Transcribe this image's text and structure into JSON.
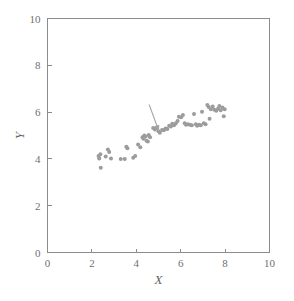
{
  "chart_data": {
    "type": "scatter",
    "title": "",
    "xlabel": "X",
    "ylabel": "Y",
    "xlim": [
      0,
      10
    ],
    "ylim": [
      0,
      10
    ],
    "xticks": [
      0,
      2,
      4,
      6,
      8,
      10
    ],
    "yticks": [
      0,
      2,
      4,
      6,
      8,
      10
    ],
    "xticklabels": [
      "0",
      "2",
      "4",
      "6",
      "8",
      "10"
    ],
    "yticklabels": [
      "0",
      "2",
      "4",
      "6",
      "8",
      "10"
    ],
    "grid": false,
    "legend": null,
    "marker_color": "#9c9c9c",
    "axis_color": "#8c8c8c",
    "background_color": "#ffffff",
    "marker_size": 4.0,
    "series": [
      {
        "name": "observations",
        "points": [
          [
            2.3,
            4.12
          ],
          [
            2.33,
            4.02
          ],
          [
            2.38,
            4.2
          ],
          [
            2.4,
            3.62
          ],
          [
            2.62,
            4.1
          ],
          [
            2.72,
            4.4
          ],
          [
            2.78,
            4.3
          ],
          [
            2.86,
            4.02
          ],
          [
            3.3,
            4.0
          ],
          [
            3.48,
            4.0
          ],
          [
            3.55,
            4.52
          ],
          [
            3.6,
            4.45
          ],
          [
            3.86,
            4.05
          ],
          [
            3.95,
            4.12
          ],
          [
            4.08,
            4.62
          ],
          [
            4.18,
            4.5
          ],
          [
            4.28,
            4.92
          ],
          [
            4.32,
            4.86
          ],
          [
            4.36,
            5.0
          ],
          [
            4.42,
            4.96
          ],
          [
            4.46,
            4.78
          ],
          [
            4.52,
            4.74
          ],
          [
            4.56,
            5.02
          ],
          [
            4.62,
            4.92
          ],
          [
            4.76,
            5.32
          ],
          [
            4.84,
            5.26
          ],
          [
            4.92,
            5.34
          ],
          [
            5.0,
            5.18
          ],
          [
            5.06,
            5.12
          ],
          [
            5.16,
            5.24
          ],
          [
            5.24,
            5.22
          ],
          [
            5.32,
            5.3
          ],
          [
            5.4,
            5.28
          ],
          [
            5.48,
            5.42
          ],
          [
            5.56,
            5.38
          ],
          [
            5.62,
            5.5
          ],
          [
            5.7,
            5.44
          ],
          [
            5.78,
            5.52
          ],
          [
            5.86,
            5.62
          ],
          [
            5.92,
            5.8
          ],
          [
            6.02,
            5.78
          ],
          [
            6.1,
            5.88
          ],
          [
            6.18,
            5.52
          ],
          [
            6.24,
            5.46
          ],
          [
            6.32,
            5.48
          ],
          [
            6.42,
            5.46
          ],
          [
            6.5,
            5.44
          ],
          [
            6.6,
            5.92
          ],
          [
            6.68,
            5.48
          ],
          [
            6.74,
            5.42
          ],
          [
            6.82,
            5.46
          ],
          [
            6.9,
            5.44
          ],
          [
            6.96,
            6.02
          ],
          [
            7.04,
            5.52
          ],
          [
            7.12,
            5.48
          ],
          [
            7.2,
            6.3
          ],
          [
            7.26,
            6.22
          ],
          [
            7.3,
            5.72
          ],
          [
            7.36,
            6.12
          ],
          [
            7.44,
            6.24
          ],
          [
            7.52,
            6.1
          ],
          [
            7.6,
            6.06
          ],
          [
            7.68,
            6.14
          ],
          [
            7.74,
            6.26
          ],
          [
            7.8,
            6.08
          ],
          [
            7.88,
            6.2
          ],
          [
            7.94,
            5.82
          ],
          [
            7.98,
            6.12
          ]
        ]
      }
    ],
    "annotations": [
      {
        "type": "arrow",
        "label": "",
        "tail": [
          4.58,
          6.32
        ],
        "head": [
          5.02,
          5.18
        ]
      }
    ]
  }
}
